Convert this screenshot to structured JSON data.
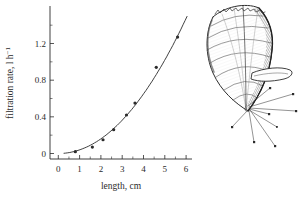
{
  "figure": {
    "background": "#ffffff",
    "ink_color": "#2b2b2b"
  },
  "chart_data": {
    "type": "scatter",
    "title": "",
    "xlabel": "length, cm",
    "ylabel": "filtration rate, l h⁻¹",
    "ylabel_main": "filtration rate, l h",
    "ylabel_sup": "−1",
    "xlim": [
      0,
      6.3
    ],
    "ylim": [
      0,
      1.55
    ],
    "x_ticks": [
      0,
      1,
      2,
      3,
      4,
      5,
      6
    ],
    "x_tick_labels": [
      "0",
      "1",
      "2",
      "3",
      "4",
      "5",
      "6"
    ],
    "x_minor_ticks": [
      0.5,
      1.5,
      2.5,
      3.5,
      4.5,
      5.5
    ],
    "y_ticks": [
      0,
      0.4,
      0.8,
      1.2
    ],
    "y_tick_labels": [
      "0",
      "0.4",
      "0.8",
      "1.2"
    ],
    "y_minor_ticks": [
      0.2,
      0.6,
      1.0,
      1.4
    ],
    "grid": false,
    "legend": "none",
    "points": [
      [
        0.8,
        0.02
      ],
      [
        1.6,
        0.07
      ],
      [
        2.1,
        0.15
      ],
      [
        2.6,
        0.26
      ],
      [
        3.2,
        0.42
      ],
      [
        3.6,
        0.55
      ],
      [
        4.6,
        0.94
      ],
      [
        5.6,
        1.27
      ]
    ],
    "fit_curve": {
      "type": "power",
      "a": 0.0395,
      "b": 2.02,
      "x_start": 0.25,
      "x_end": 6.05
    }
  },
  "illustration": {
    "label": "mussel-with-byssal-threads"
  }
}
